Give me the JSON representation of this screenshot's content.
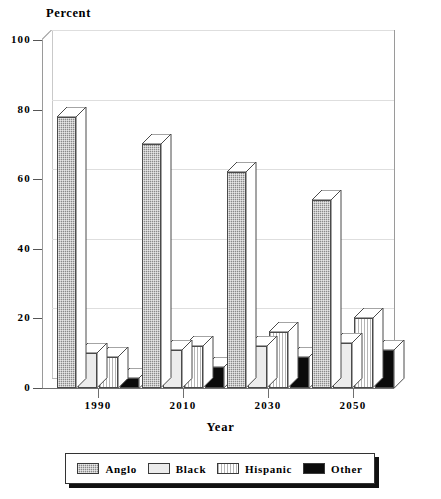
{
  "chart_data": {
    "type": "bar",
    "title": "Percent",
    "xlabel": "Year",
    "ylabel": "Percent",
    "categories": [
      "1990",
      "2010",
      "2030",
      "2050"
    ],
    "series": [
      {
        "name": "Anglo",
        "values": [
          78,
          70,
          62,
          54
        ],
        "pattern": "gray-dotted",
        "color": "#8a8a8a"
      },
      {
        "name": "Black",
        "values": [
          10,
          11,
          12,
          13
        ],
        "pattern": "white-solid",
        "color": "#ececec"
      },
      {
        "name": "Hispanic",
        "values": [
          9,
          12,
          16,
          20
        ],
        "pattern": "vertical-stripes",
        "color": "#b5b5b5"
      },
      {
        "name": "Other",
        "values": [
          3,
          6,
          9,
          11
        ],
        "pattern": "black-solid",
        "color": "#0b0b0b"
      }
    ],
    "ylim": [
      0,
      100
    ],
    "yticks": [
      "0",
      "20",
      "40",
      "60",
      "80",
      "100"
    ],
    "ytick_values": [
      0,
      20,
      40,
      60,
      80,
      100
    ],
    "grid": true,
    "legend_position": "bottom",
    "style": "3d-bar"
  },
  "axis": {
    "y_title": "Percent",
    "x_title": "Year"
  },
  "legend": {
    "items": [
      {
        "label": "Anglo"
      },
      {
        "label": "Black"
      },
      {
        "label": "Hispanic"
      },
      {
        "label": "Other"
      }
    ]
  }
}
